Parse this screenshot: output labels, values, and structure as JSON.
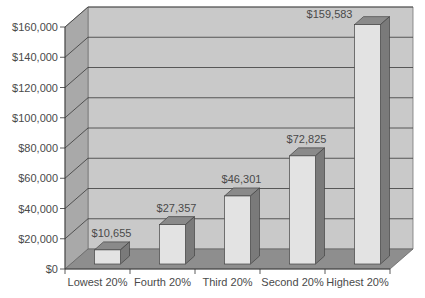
{
  "chart_data": {
    "type": "bar",
    "style": "3d",
    "title": "",
    "xlabel": "",
    "ylabel": "",
    "categories": [
      "Lowest 20%",
      "Fourth 20%",
      "Third 20%",
      "Second 20%",
      "Highest 20%"
    ],
    "values": [
      10655,
      27357,
      46301,
      72825,
      159583
    ],
    "data_labels": [
      "$10,655",
      "$27,357",
      "$46,301",
      "$72,825",
      "$159,583"
    ],
    "y_ticks": [
      0,
      20000,
      40000,
      60000,
      80000,
      100000,
      120000,
      140000,
      160000
    ],
    "y_tick_labels": [
      "$0",
      "$20,000",
      "$40,000",
      "$60,000",
      "$80,000",
      "$100,000",
      "$120,000",
      "$140,000",
      "$160,000"
    ],
    "ylim": [
      0,
      160000
    ],
    "grid": true,
    "legend": "none"
  },
  "colors": {
    "wall": "#c9c9c9",
    "side_wall": "#a9a9a9",
    "floor": "#8e8e8e",
    "bar_front": "#e3e3e3",
    "bar_top": "#8a8a8a",
    "bar_side": "#7a7a7a",
    "grid": "#3a3a3a",
    "text": "#4a4a4a"
  }
}
